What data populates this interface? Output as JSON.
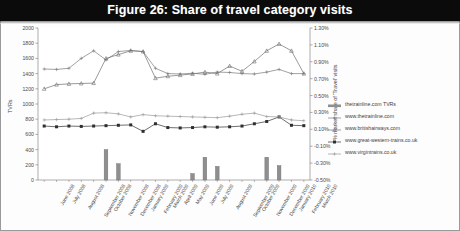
{
  "figure": {
    "title": "Figure 26: Share of travel category visits",
    "title_bar_color": "#0b0b0b",
    "title_text_color": "#ffffff"
  },
  "chart_data": {
    "type": "bar",
    "title": "Figure 26: Share of travel category visits",
    "xlabel": "",
    "ylabel": "TVRs",
    "y2label": "% market share of 'Travel' visits",
    "ylim": [
      0,
      2000
    ],
    "ytick_step": 200,
    "yticks": [
      "0",
      "200",
      "400",
      "600",
      "800",
      "1000",
      "1200",
      "1400",
      "1600",
      "1800",
      "2000"
    ],
    "y2lim": [
      -0.5,
      1.3
    ],
    "y2tick_step": 0.2,
    "y2ticks": [
      "-0.50%",
      "-0.30%",
      "-0.10%",
      "0.10%",
      "0.30%",
      "0.50%",
      "0.70%",
      "0.90%",
      "1.10%",
      "1.30%"
    ],
    "grid": false,
    "legend_position": "right",
    "categories": [
      "June 2008",
      "July 2008",
      "August 2008",
      "September 2008",
      "October 2008",
      "November 2008",
      "December 2008",
      "January 2009",
      "February 2009",
      "March 2009",
      "April 2009",
      "May 2009",
      "June 2009",
      "July 2009",
      "August 2009",
      "September 2009",
      "October 2009",
      "November 2009",
      "December 2009",
      "January 2010",
      "February 2010",
      "March 2010"
    ],
    "series": [
      {
        "name": "thetrainline.com TVRs",
        "type": "bar",
        "axis": "left",
        "color": "#8f8f8f",
        "values": [
          0,
          0,
          0,
          0,
          0,
          400,
          215,
          0,
          0,
          0,
          0,
          0,
          85,
          300,
          180,
          0,
          0,
          0,
          300,
          190,
          0,
          0
        ]
      },
      {
        "name": "www.thetrainline.com",
        "type": "line",
        "axis": "right",
        "color": "#7a7a7a",
        "marker": "plus",
        "values_tvr": [
          1460,
          1455,
          1470,
          1600,
          1700,
          1580,
          1690,
          1705,
          1690,
          1470,
          1400,
          1395,
          1405,
          1390,
          1420,
          1415,
          1400,
          1395,
          1420,
          1455,
          1400,
          1400
        ],
        "values": [
          0.816,
          0.811,
          0.825,
          0.941,
          1.031,
          0.926,
          1.025,
          1.038,
          1.025,
          0.825,
          0.762,
          0.758,
          0.767,
          0.754,
          0.781,
          0.777,
          0.762,
          0.758,
          0.781,
          0.816,
          0.762,
          0.762
        ]
      },
      {
        "name": "www.britishairways.com",
        "type": "line",
        "axis": "right",
        "color": "#6e6e6e",
        "marker": "triangle",
        "values_tvr": [
          1200,
          1255,
          1265,
          1270,
          1275,
          1600,
          1650,
          1700,
          1690,
          1340,
          1365,
          1380,
          1395,
          1420,
          1400,
          1500,
          1430,
          1560,
          1700,
          1790,
          1700,
          1400
        ],
        "values": [
          0.58,
          0.63,
          0.639,
          0.643,
          0.648,
          0.941,
          0.986,
          1.031,
          1.022,
          0.706,
          0.729,
          0.742,
          0.755,
          0.778,
          0.76,
          0.85,
          0.787,
          0.904,
          1.031,
          1.112,
          1.031,
          0.762
        ]
      },
      {
        "name": "www.great-western-trains.co.uk",
        "type": "line",
        "axis": "right",
        "color": "#2f2f2f",
        "marker": "square",
        "values_tvr": [
          710,
          700,
          710,
          705,
          710,
          715,
          720,
          725,
          640,
          740,
          690,
          685,
          690,
          700,
          695,
          700,
          710,
          740,
          770,
          830,
          720,
          715
        ],
        "values": [
          0.139,
          0.13,
          0.139,
          0.135,
          0.139,
          0.144,
          0.148,
          0.153,
          0.076,
          0.166,
          0.121,
          0.117,
          0.121,
          0.13,
          0.126,
          0.13,
          0.139,
          0.166,
          0.193,
          0.247,
          0.148,
          0.144
        ]
      },
      {
        "name": "www.virgintrains.co.uk",
        "type": "line",
        "axis": "right",
        "color": "#9a9a9a",
        "marker": "plus",
        "values_tvr": [
          790,
          795,
          800,
          810,
          880,
          885,
          870,
          830,
          860,
          845,
          840,
          835,
          830,
          825,
          820,
          840,
          865,
          880,
          835,
          830,
          790,
          780
        ],
        "values": [
          0.211,
          0.216,
          0.22,
          0.229,
          0.292,
          0.297,
          0.283,
          0.247,
          0.274,
          0.261,
          0.256,
          0.252,
          0.247,
          0.243,
          0.238,
          0.256,
          0.279,
          0.292,
          0.252,
          0.247,
          0.211,
          0.202
        ]
      }
    ]
  }
}
